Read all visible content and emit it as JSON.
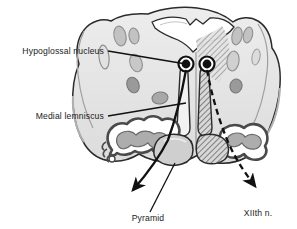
{
  "figure": {
    "kind": "anatomical-cross-section",
    "background_color": "#ffffff",
    "outline_color": "#2b2b2b",
    "leader_color": "#111111"
  },
  "labels": [
    {
      "id": "hypoglossal-nucleus",
      "text": "Hypoglossal nucleus",
      "anchor": "end",
      "x": 104,
      "y": 54,
      "leader": "M108,51 L186,64",
      "leader_style": "solid"
    },
    {
      "id": "medial-lemniscus",
      "text": "Medial lemniscus",
      "anchor": "end",
      "x": 104,
      "y": 119,
      "leader": "M108,116 L186,103",
      "leader_style": "solid"
    },
    {
      "id": "pyramid",
      "text": "Pyramid",
      "anchor": "middle",
      "x": 148,
      "y": 221,
      "leader": "M150,212 L175,163",
      "leader_style": "solid"
    },
    {
      "id": "xiith-nerve",
      "text": "XIIth n.",
      "anchor": "middle",
      "x": 258,
      "y": 216,
      "leader": "",
      "leader_style": "none"
    }
  ],
  "pathways": [
    {
      "id": "left-corticospinal-arrow",
      "side": "left",
      "style": "solid",
      "description": "Hypoglossal nucleus to pyramid exit, solid arrow pointing down-left"
    },
    {
      "id": "right-hypoglossal-nerve-arrow",
      "side": "right",
      "style": "dashed",
      "description": "Hypoglossal nerve rootlets exiting ventrally, dashed arrow pointing down-right"
    }
  ],
  "structures": {
    "hypoglossal_nuclei": {
      "count": 2,
      "fill": "#111111"
    },
    "medial_lemnisci": {
      "count": 2,
      "left_fill": "#efefef",
      "right_fill": "hatched"
    },
    "inferior_olivary_nuclei": {
      "count": 2,
      "fill": "#9a9a9a"
    },
    "pyramids": {
      "count": 2,
      "left_fill": "#c9c9c9",
      "right_fill": "hatched"
    },
    "fourth_ventricle_floor": {
      "fill": "#ffffff"
    },
    "tegmentum": {
      "fill": "#e8e8e8"
    },
    "hatch_side": "right"
  },
  "colors": {
    "tissue_light": "#e9e9e9",
    "tissue_mid": "#d2d2d2",
    "tissue_dark": "#9a9a9a",
    "tract_gray": "#b5b5b5",
    "ink": "#2b2b2b",
    "hatch": "#8d8d8d"
  }
}
